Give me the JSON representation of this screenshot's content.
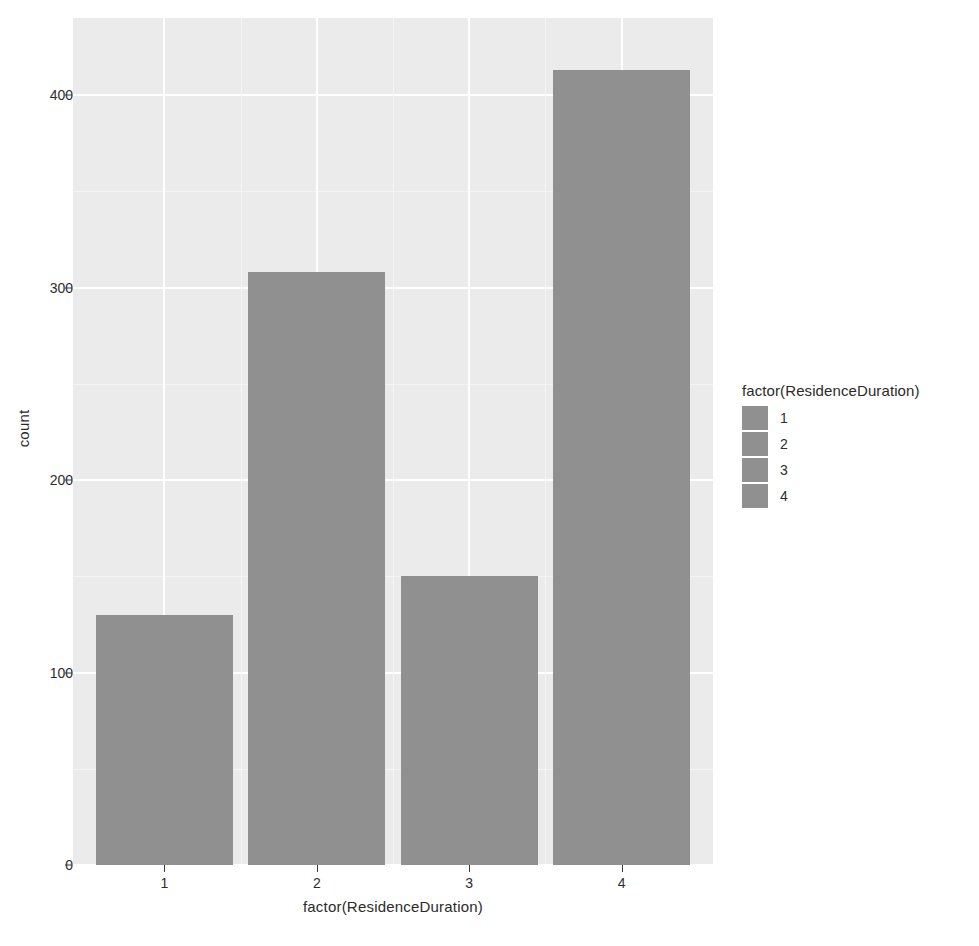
{
  "chart_data": {
    "type": "bar",
    "title": "",
    "subtitle": "",
    "xlabel": "factor(ResidenceDuration)",
    "ylabel": "count",
    "categories": [
      "1",
      "2",
      "3",
      "4"
    ],
    "values": [
      130,
      308,
      150,
      413
    ],
    "series": [
      {
        "name": "count",
        "values": [
          130,
          308,
          150,
          413
        ]
      }
    ],
    "ylim": [
      0,
      440
    ],
    "xlim": [
      0.4,
      4.6
    ],
    "y_ticks": [
      0,
      100,
      200,
      300,
      400
    ],
    "y_tick_labels": [
      "0",
      "100",
      "200",
      "300",
      "400"
    ],
    "y_minor_ticks": [
      50,
      150,
      250,
      350
    ],
    "x_ticks": [
      1,
      2,
      3,
      4
    ],
    "x_tick_labels": [
      "1",
      "2",
      "3",
      "4"
    ],
    "grid": true,
    "legend": {
      "title": "factor(ResidenceDuration)",
      "position": "right",
      "entries": [
        {
          "label": "1",
          "color": "#909090"
        },
        {
          "label": "2",
          "color": "#909090"
        },
        {
          "label": "3",
          "color": "#909090"
        },
        {
          "label": "4",
          "color": "#909090"
        }
      ]
    },
    "colors": {
      "bar_fill": "#909090",
      "panel_background": "#ebebeb",
      "grid_major": "#ffffff",
      "grid_minor": "#f5f5f5",
      "plot_background": "#ffffff",
      "text": "#2b2b2b"
    }
  }
}
